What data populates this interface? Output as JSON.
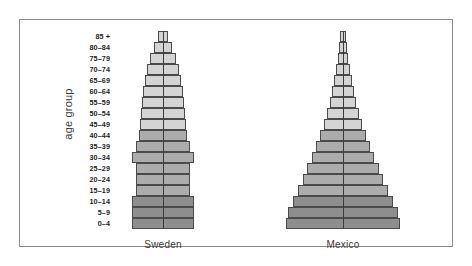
{
  "figure": {
    "axis_title": "age group",
    "background": "#ffffff",
    "frame_color": "#8a8a8a"
  },
  "palette": {
    "post_reproductive": "#d4d4d4",
    "reproductive": "#acacac",
    "pre_reproductive": "#8e8e8e",
    "outline": "#4a4a4a",
    "centerline": "#3c3c3c",
    "label_color": "#1d1d1d",
    "country_label_color": "#3a3a3a"
  },
  "chart_data": {
    "type": "bar",
    "subtype": "population-pyramid",
    "title": "",
    "xlabel": "",
    "ylabel": "age group",
    "grid": false,
    "legend_position": "none",
    "orientation": "horizontal-back-to-back",
    "categories": [
      "0-4",
      "5-9",
      "10-14",
      "15-19",
      "20-24",
      "25-29",
      "30-34",
      "35-39",
      "40-44",
      "45-49",
      "50-54",
      "55-59",
      "60-64",
      "65-69",
      "70-74",
      "75-79",
      "80-84",
      "85+"
    ],
    "category_order": "bottom-to-top",
    "bands": [
      {
        "name": "pre-reproductive",
        "age_range": "0-14",
        "categories": [
          "0-4",
          "5-9",
          "10-14"
        ],
        "color": "#8e8e8e"
      },
      {
        "name": "reproductive",
        "age_range": "15-44",
        "categories": [
          "15-19",
          "20-24",
          "25-29",
          "30-34",
          "35-39",
          "40-44"
        ],
        "color": "#acacac"
      },
      {
        "name": "post-reproductive",
        "age_range": "45+",
        "categories": [
          "45-49",
          "50-54",
          "55-59",
          "60-64",
          "65-69",
          "70-74",
          "75-79",
          "80-84",
          "85+"
        ],
        "color": "#d4d4d4"
      }
    ],
    "panels": [
      {
        "name": "Sweden",
        "label": "Sweden",
        "growth_type": "slow-growth",
        "series": [
          {
            "name": "male",
            "side": "left",
            "values": [
              31,
              31,
              31,
              27,
              27,
              27,
              31,
              27,
              24,
              23,
              22,
              21,
              20,
              18,
              16,
              13,
              9,
              5
            ]
          },
          {
            "name": "female",
            "side": "right",
            "values": [
              31,
              31,
              31,
              27,
              27,
              27,
              31,
              27,
              24,
              23,
              22,
              21,
              20,
              18,
              16,
              13,
              9,
              5
            ]
          }
        ]
      },
      {
        "name": "Mexico",
        "label": "Mexico",
        "growth_type": "rapid-growth",
        "series": [
          {
            "name": "male",
            "side": "left",
            "values": [
              57,
              55,
              50,
              45,
              40,
              36,
              31,
              27,
              23,
              19,
              16,
              13,
              11,
              9,
              7,
              5,
              4,
              3
            ]
          },
          {
            "name": "female",
            "side": "right",
            "values": [
              57,
              55,
              50,
              45,
              40,
              36,
              31,
              27,
              23,
              19,
              16,
              13,
              11,
              9,
              7,
              5,
              4,
              3
            ]
          }
        ]
      }
    ]
  }
}
